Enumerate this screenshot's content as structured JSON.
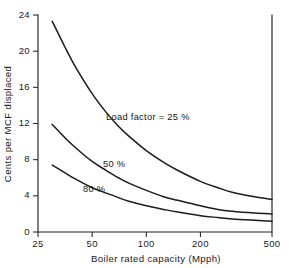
{
  "chart_data": {
    "type": "line",
    "title": "",
    "xlabel": "Boiler rated capacity (Mpph)",
    "ylabel": "Cents per MCF displaced",
    "xscale": "log",
    "yscale": "linear",
    "xlim": [
      25,
      500
    ],
    "ylim": [
      0,
      24
    ],
    "grid": false,
    "legend_position": "inline-annotations",
    "xticks": [
      25,
      50,
      100,
      200,
      500
    ],
    "xtick_labels": [
      "25",
      "50",
      "100",
      "200",
      "500"
    ],
    "yticks": [
      0,
      4,
      8,
      12,
      16,
      20,
      24
    ],
    "ytick_labels": [
      "0",
      "4",
      "8",
      "12",
      "16",
      "20",
      "24"
    ],
    "series": [
      {
        "name": "Load factor = 25 %",
        "annotation": "Load factor = 25 %",
        "x": [
          30,
          35,
          40,
          50,
          60,
          70,
          80,
          100,
          125,
          150,
          200,
          250,
          300,
          400,
          500
        ],
        "y": [
          23.3,
          20.6,
          18.4,
          15.3,
          13.2,
          11.7,
          10.6,
          9.0,
          7.7,
          6.8,
          5.6,
          4.9,
          4.4,
          3.9,
          3.6
        ]
      },
      {
        "name": "50 %",
        "annotation": "50 %",
        "x": [
          30,
          35,
          40,
          50,
          60,
          70,
          80,
          100,
          125,
          150,
          200,
          250,
          300,
          400,
          500
        ],
        "y": [
          11.9,
          10.5,
          9.4,
          7.8,
          6.8,
          6.0,
          5.4,
          4.6,
          3.9,
          3.5,
          2.9,
          2.5,
          2.3,
          2.1,
          2.0
        ]
      },
      {
        "name": "80 %",
        "annotation": "80 %",
        "x": [
          30,
          35,
          40,
          50,
          60,
          70,
          80,
          100,
          125,
          150,
          200,
          250,
          300,
          400,
          500
        ],
        "y": [
          7.4,
          6.6,
          5.9,
          4.9,
          4.3,
          3.8,
          3.4,
          2.9,
          2.5,
          2.2,
          1.8,
          1.6,
          1.45,
          1.3,
          1.2
        ]
      }
    ],
    "annotations": [
      {
        "text": "Load factor = 25 %",
        "x_px": 106,
        "y_px": 120
      },
      {
        "text": "50 %",
        "x_px": 103,
        "y_px": 167
      },
      {
        "text": "80 %",
        "x_px": 83,
        "y_px": 192
      }
    ],
    "colors": {
      "curve": "#1b1b1b",
      "axis": "#232323",
      "text": "#1a1a1a",
      "background": "#ffffff"
    }
  }
}
